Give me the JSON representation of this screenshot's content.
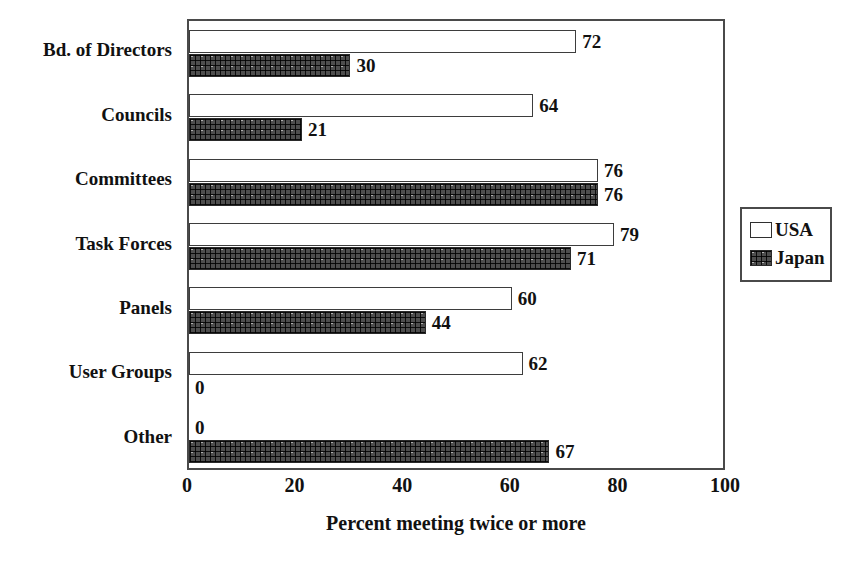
{
  "chart_data": {
    "type": "bar",
    "orientation": "horizontal",
    "title": "",
    "xlabel": "Percent meeting twice or more",
    "ylabel": "",
    "xlim": [
      0,
      100
    ],
    "xticks": [
      "0",
      "20",
      "40",
      "60",
      "80",
      "100"
    ],
    "grid": false,
    "legend_position": "right",
    "categories": [
      "Bd. of Directors",
      "Councils",
      "Committees",
      "Task Forces",
      "Panels",
      "User Groups",
      "Other"
    ],
    "series": [
      {
        "name": "USA",
        "color": "#ffffff",
        "values": [
          72,
          64,
          76,
          79,
          60,
          62,
          0
        ]
      },
      {
        "name": "Japan",
        "color": "#4e4e4e",
        "values": [
          30,
          21,
          76,
          71,
          44,
          0,
          67
        ]
      }
    ],
    "data_labels": {
      "Bd. of Directors": {
        "USA": "72",
        "Japan": "30"
      },
      "Councils": {
        "USA": "64",
        "Japan": "21"
      },
      "Committees": {
        "USA": "76",
        "Japan": "76"
      },
      "Task Forces": {
        "USA": "79",
        "Japan": "71"
      },
      "Panels": {
        "USA": "60",
        "Japan": "44"
      },
      "User Groups": {
        "USA": "62",
        "Japan": "0"
      },
      "Other": {
        "USA": "0",
        "Japan": "67"
      }
    }
  },
  "legend": {
    "items": [
      {
        "label": "USA",
        "swatch": "hollow-square-icon"
      },
      {
        "label": "Japan",
        "swatch": "crosshatch-square-icon"
      }
    ]
  }
}
